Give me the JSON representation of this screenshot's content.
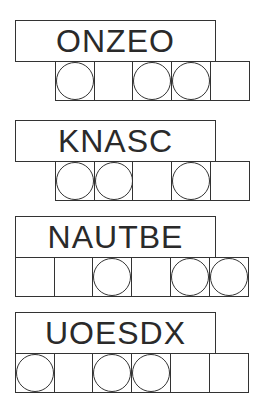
{
  "puzzles": [
    {
      "scrambled": "ONZEO",
      "cells": [
        false,
        true,
        false,
        true,
        true,
        false
      ],
      "cells_start": 1
    },
    {
      "scrambled": "KNASC",
      "cells": [
        false,
        true,
        true,
        false,
        true,
        false
      ],
      "cells_start": 1
    },
    {
      "scrambled": "NAUTBE",
      "cells": [
        false,
        false,
        true,
        false,
        true,
        true
      ],
      "cells_start": 0
    },
    {
      "scrambled": "UOESDX",
      "cells": [
        true,
        false,
        true,
        true,
        false,
        false
      ],
      "cells_start": 0
    }
  ]
}
